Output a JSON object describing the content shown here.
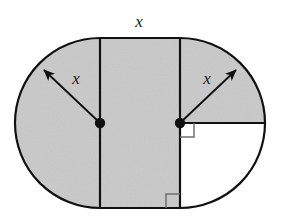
{
  "figure": {
    "background_color": "#ffffff",
    "shaded_color": "#c9c9c9",
    "unshaded_color": "#ffffff",
    "stroke_color": "#111111",
    "labels": {
      "top_width": "x",
      "left_radius": "x",
      "right_radius": "x"
    },
    "geometry": {
      "rect_left_x": 100,
      "rect_right_x": 180,
      "rect_top_y": 38,
      "rect_bottom_y": 208,
      "radius": 85,
      "left_center": {
        "x": 100,
        "y": 123
      },
      "right_center": {
        "x": 180,
        "y": 123
      },
      "left_extreme_x": 15,
      "right_extreme_x": 265
    },
    "markers": {
      "left_center_dot": "center-point-dot",
      "right_center_dot": "center-point-dot",
      "right_angle_upper": "right-angle-mark",
      "right_angle_lower": "right-angle-mark"
    },
    "arrows": {
      "left": {
        "from_x": 100,
        "from_y": 123,
        "to_x": 42,
        "to_y": 68,
        "label": "x",
        "label_x": 76,
        "label_y": 84
      },
      "right": {
        "from_x": 180,
        "from_y": 123,
        "to_x": 238,
        "to_y": 68,
        "label": "x",
        "label_x": 207,
        "label_y": 84
      }
    },
    "top_label_position": {
      "x": 139,
      "y": 27
    }
  }
}
